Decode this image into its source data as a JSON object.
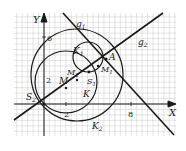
{
  "figure": {
    "axes": {
      "x_label": "X",
      "y_label": "Y",
      "x_tick_labels": [
        {
          "value": 2,
          "text": "2"
        },
        {
          "value": 8,
          "text": "8"
        }
      ],
      "y_tick_labels": [
        {
          "value": 2,
          "text": "2"
        },
        {
          "value": 6,
          "text": "6"
        }
      ]
    },
    "points": {
      "S2": {
        "label": "S",
        "sub": "2"
      },
      "S1": {
        "label": "S",
        "sub": "1"
      },
      "A": {
        "label": "A"
      },
      "M": {
        "label": "M"
      },
      "M2": {
        "label": "M",
        "sub": "2"
      },
      "M1": {
        "label": "M",
        "sub": "1"
      }
    },
    "circles": {
      "K": {
        "label": "K"
      },
      "K1": {
        "label": "K",
        "sub": "1"
      },
      "K2": {
        "label": "K",
        "sub": "2"
      }
    },
    "lines": {
      "g1": {
        "label": "g",
        "sub": "1"
      },
      "g2": {
        "label": "g",
        "sub": "2"
      }
    },
    "colors": {
      "grid": "#c8c8c8",
      "ink": "#1a1a1a",
      "background": "#ffffff"
    }
  }
}
